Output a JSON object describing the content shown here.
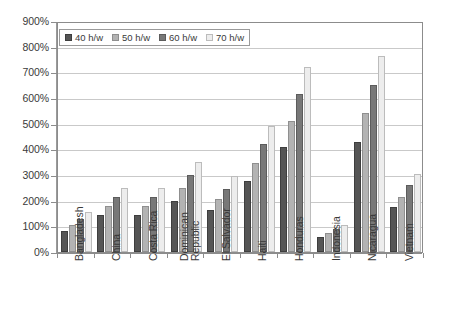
{
  "chart_data": {
    "type": "bar",
    "title": "",
    "subtitle": "",
    "xlabel": "",
    "ylabel": "",
    "ylim": [
      0,
      900
    ],
    "y_unit": "%",
    "y_ticks": [
      "0%",
      "100%",
      "200%",
      "300%",
      "400%",
      "500%",
      "600%",
      "700%",
      "800%",
      "900%"
    ],
    "y_tick_values": [
      0,
      100,
      200,
      300,
      400,
      500,
      600,
      700,
      800,
      900
    ],
    "grid": true,
    "legend_position": "top-left",
    "categories": [
      "Bangladesh",
      "China",
      "Costa Rica",
      "Dominican\nRepublic",
      "El Salvador",
      "Haiti",
      "Honduras",
      "Indonesia",
      "Nicaragua",
      "Vietnam"
    ],
    "series": [
      {
        "name": "40 h/w",
        "color": "#555555",
        "values": [
          80,
          145,
          145,
          200,
          165,
          275,
          410,
          60,
          430,
          175
        ]
      },
      {
        "name": "50 h/w",
        "color": "#b3b3b3",
        "values": [
          105,
          180,
          180,
          250,
          205,
          345,
          510,
          75,
          540,
          215
        ]
      },
      {
        "name": "60 h/w",
        "color": "#787878",
        "values": [
          130,
          215,
          215,
          300,
          245,
          420,
          615,
          90,
          650,
          260
        ]
      },
      {
        "name": "70 h/w",
        "color": "#ededed",
        "values": [
          155,
          250,
          250,
          350,
          295,
          490,
          720,
          105,
          765,
          305
        ]
      }
    ],
    "annotations": []
  },
  "colors": {
    "series_40": "#555555",
    "series_50": "#b3b3b3",
    "series_60": "#787878",
    "series_70": "#ededed",
    "gridline": "#c9c9c9",
    "axis": "#8c8c8c",
    "text": "#3a3a3a",
    "background": "#ffffff"
  }
}
